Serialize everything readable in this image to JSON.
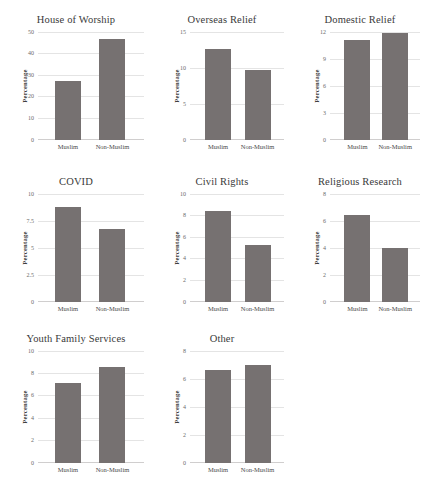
{
  "figure": {
    "layout": "3x3 grid of small-multiple bar charts, last cell empty",
    "background": "#ffffff",
    "bar_color": "#767171",
    "gridline_color": "#e4e4e4"
  },
  "chart_data": [
    {
      "type": "bar",
      "title": "House of Worship",
      "categories": [
        "Muslim",
        "Non-Muslim"
      ],
      "values": [
        27.0,
        46.5
      ],
      "xlabel": "",
      "ylabel": "Percentage",
      "ylim": [
        0,
        50
      ],
      "yticks": [
        0,
        10,
        20,
        30,
        40,
        50
      ],
      "ytick_labels": [
        "0",
        "10",
        "20",
        "30",
        "40",
        "50"
      ],
      "grid": true,
      "legend": "none"
    },
    {
      "type": "bar",
      "title": "Overseas Relief",
      "categories": [
        "Muslim",
        "Non-Muslim"
      ],
      "values": [
        12.6,
        9.7
      ],
      "xlabel": "",
      "ylabel": "Percentage",
      "ylim": [
        0,
        15
      ],
      "yticks": [
        0,
        5,
        10,
        15
      ],
      "ytick_labels": [
        "0",
        "5",
        "10",
        "15"
      ],
      "grid": true,
      "legend": "none"
    },
    {
      "type": "bar",
      "title": "Domestic Relief",
      "categories": [
        "Muslim",
        "Non-Muslim"
      ],
      "values": [
        11.1,
        11.8
      ],
      "xlabel": "",
      "ylabel": "Percentage",
      "ylim": [
        0,
        12
      ],
      "yticks": [
        0,
        3,
        6,
        9,
        12
      ],
      "ytick_labels": [
        "0",
        "3",
        "6",
        "9",
        "12"
      ],
      "grid": true,
      "legend": "none"
    },
    {
      "type": "bar",
      "title": "COVID",
      "categories": [
        "Muslim",
        "Non-Muslim"
      ],
      "values": [
        8.8,
        6.7
      ],
      "xlabel": "",
      "ylabel": "Percentage",
      "ylim": [
        0,
        10
      ],
      "yticks": [
        0,
        2.5,
        5,
        7.5,
        10
      ],
      "ytick_labels": [
        "0",
        "2.5",
        "5",
        "7.5",
        "10"
      ],
      "grid": true,
      "legend": "none"
    },
    {
      "type": "bar",
      "title": "Civil Rights",
      "categories": [
        "Muslim",
        "Non-Muslim"
      ],
      "values": [
        8.4,
        5.2
      ],
      "xlabel": "",
      "ylabel": "Percentage",
      "ylim": [
        0,
        10
      ],
      "yticks": [
        0,
        2,
        4,
        6,
        8,
        10
      ],
      "ytick_labels": [
        "0",
        "2",
        "4",
        "6",
        "8",
        "10"
      ],
      "grid": true,
      "legend": "none"
    },
    {
      "type": "bar",
      "title": "Religious Research",
      "categories": [
        "Muslim",
        "Non-Muslim"
      ],
      "values": [
        6.4,
        3.95
      ],
      "xlabel": "",
      "ylabel": "Percentage",
      "ylim": [
        0,
        8
      ],
      "yticks": [
        0,
        2,
        4,
        6,
        8
      ],
      "ytick_labels": [
        "0",
        "2",
        "4",
        "6",
        "8"
      ],
      "grid": true,
      "legend": "none"
    },
    {
      "type": "bar",
      "title": "Youth Family Services",
      "categories": [
        "Muslim",
        "Non-Muslim"
      ],
      "values": [
        7.1,
        8.5
      ],
      "xlabel": "",
      "ylabel": "Percentage",
      "ylim": [
        0,
        10
      ],
      "yticks": [
        0,
        2,
        4,
        6,
        8,
        10
      ],
      "ytick_labels": [
        "0",
        "2",
        "4",
        "6",
        "8",
        "10"
      ],
      "grid": true,
      "legend": "none"
    },
    {
      "type": "bar",
      "title": "Other",
      "categories": [
        "Muslim",
        "Non-Muslim"
      ],
      "values": [
        6.6,
        7.0
      ],
      "xlabel": "",
      "ylabel": "Percentage",
      "ylim": [
        0,
        8
      ],
      "yticks": [
        0,
        2,
        4,
        6,
        8
      ],
      "ytick_labels": [
        "0",
        "2",
        "4",
        "6",
        "8"
      ],
      "grid": true,
      "legend": "none"
    }
  ]
}
